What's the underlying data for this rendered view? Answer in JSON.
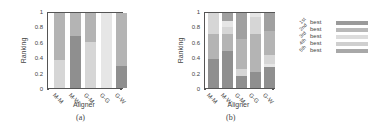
{
  "chart_data": [
    {
      "type": "bar",
      "stacked": true,
      "panel_label": "(a)",
      "title": "",
      "xlabel": "Aligner",
      "ylabel": "Ranking",
      "ylim": [
        0,
        1
      ],
      "yticks": [
        "0",
        "0.2",
        "0.4",
        "0.6",
        "0.8",
        "1"
      ],
      "categories": [
        "M-M",
        "M-W",
        "G-M",
        "G-G",
        "G-W"
      ],
      "series": [
        {
          "name": "1st best",
          "values": [
            0.0,
            0.7,
            0.0,
            0.0,
            0.3
          ]
        },
        {
          "name": "2nd best",
          "values": [
            0.62,
            0.3,
            0.38,
            0.0,
            0.7
          ]
        },
        {
          "name": "3rd best",
          "values": [
            0.38,
            0.0,
            0.62,
            0.0,
            0.0
          ]
        },
        {
          "name": "4th best",
          "values": [
            0.0,
            0.0,
            0.0,
            1.0,
            0.0
          ]
        },
        {
          "name": "5th best",
          "values": [
            0.0,
            0.0,
            0.0,
            0.0,
            0.0
          ]
        }
      ],
      "stacks": [
        [
          {
            "s": 2,
            "v": 0.38
          },
          {
            "s": 1,
            "v": 0.62
          }
        ],
        [
          {
            "s": 0,
            "v": 0.7
          },
          {
            "s": 1,
            "v": 0.3
          }
        ],
        [
          {
            "s": 2,
            "v": 0.62
          },
          {
            "s": 1,
            "v": 0.38
          }
        ],
        [
          {
            "s": 3,
            "v": 1.0
          }
        ],
        [
          {
            "s": 0,
            "v": 0.3
          },
          {
            "s": 1,
            "v": 0.7
          }
        ]
      ],
      "grid": false
    },
    {
      "type": "bar",
      "stacked": true,
      "panel_label": "(b)",
      "title": "",
      "xlabel": "Aligner",
      "ylabel": "Ranking",
      "ylim": [
        0,
        1
      ],
      "yticks": [
        "0",
        "0.2",
        "0.4",
        "0.6",
        "0.8",
        "1"
      ],
      "categories": [
        "M-M",
        "M-W",
        "G-M",
        "G-G",
        "G-W"
      ],
      "series": [
        {
          "name": "1st best",
          "values": [
            0.39,
            0.5,
            0.16,
            0.22,
            0.28
          ]
        },
        {
          "name": "2nd best",
          "values": [
            0.33,
            0.22,
            0.4,
            0.5,
            0.32
          ]
        },
        {
          "name": "3rd best",
          "values": [
            0.28,
            0.1,
            0.1,
            0.23,
            0.12
          ]
        },
        {
          "name": "4th best",
          "values": [
            0.0,
            0.08,
            0.0,
            0.05,
            0.04
          ]
        },
        {
          "name": "5th best",
          "values": [
            0.0,
            0.1,
            0.34,
            0.0,
            0.24
          ]
        }
      ],
      "stacks": [
        [
          {
            "s": 0,
            "v": 0.39
          },
          {
            "s": 1,
            "v": 0.33
          },
          {
            "s": 2,
            "v": 0.28
          }
        ],
        [
          {
            "s": 0,
            "v": 0.5
          },
          {
            "s": 1,
            "v": 0.22
          },
          {
            "s": 2,
            "v": 0.1
          },
          {
            "s": 3,
            "v": 0.08
          },
          {
            "s": 4,
            "v": 0.1
          }
        ],
        [
          {
            "s": 0,
            "v": 0.16
          },
          {
            "s": 2,
            "v": 0.1
          },
          {
            "s": 1,
            "v": 0.4
          },
          {
            "s": 4,
            "v": 0.34
          }
        ],
        [
          {
            "s": 0,
            "v": 0.22
          },
          {
            "s": 1,
            "v": 0.5
          },
          {
            "s": 2,
            "v": 0.23
          },
          {
            "s": 3,
            "v": 0.05
          }
        ],
        [
          {
            "s": 0,
            "v": 0.28
          },
          {
            "s": 3,
            "v": 0.04
          },
          {
            "s": 2,
            "v": 0.12
          },
          {
            "s": 1,
            "v": 0.32
          },
          {
            "s": 4,
            "v": 0.24
          }
        ]
      ],
      "grid": false
    }
  ],
  "legend": {
    "position": "right",
    "items": [
      {
        "ordinal": "1st",
        "label": "best",
        "color": "#9a9a9a"
      },
      {
        "ordinal": "2nd",
        "label": "best",
        "color": "#b9b9b9"
      },
      {
        "ordinal": "3rd",
        "label": "best",
        "color": "#dcdcdc"
      },
      {
        "ordinal": "4th",
        "label": "best",
        "color": "#cfcfcf"
      },
      {
        "ordinal": "5th",
        "label": "best",
        "color": "#a8a8a8"
      }
    ]
  },
  "series_colors": [
    "#8f8f8f",
    "#b4b4b4",
    "#d6d6d6",
    "#e6e6e6",
    "#a0a0a0"
  ]
}
